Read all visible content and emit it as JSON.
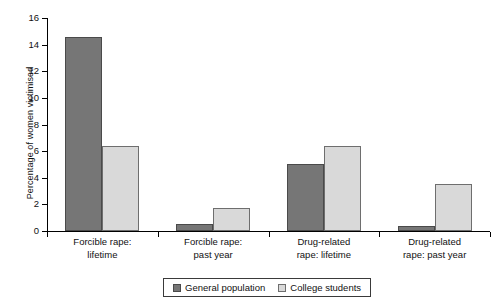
{
  "chart_data": {
    "type": "bar",
    "title": "",
    "xlabel": "",
    "ylabel": "Percentage of women victimised",
    "ylim": [
      0,
      16
    ],
    "ytick_step": 2,
    "yticks": [
      "0",
      "2",
      "4",
      "6",
      "8",
      "10",
      "12",
      "14",
      "16"
    ],
    "grid": false,
    "legend_position": "bottom-center",
    "categories": [
      "Forcible rape:\nlifetime",
      "Forcible rape:\npast year",
      "Drug-related\nrape: lifetime",
      "Drug-related\nrape: past year"
    ],
    "category_lines": [
      [
        "Forcible rape:",
        "lifetime"
      ],
      [
        "Forcible rape:",
        "past year"
      ],
      [
        "Drug-related",
        "rape: lifetime"
      ],
      [
        "Drug-related",
        "rape: past year"
      ]
    ],
    "series": [
      {
        "name": "General population",
        "color": "#767676",
        "values": [
          14.6,
          0.5,
          5.0,
          0.35
        ]
      },
      {
        "name": "College students",
        "color": "#d9d9d9",
        "values": [
          6.4,
          1.7,
          6.35,
          3.55
        ]
      }
    ]
  }
}
